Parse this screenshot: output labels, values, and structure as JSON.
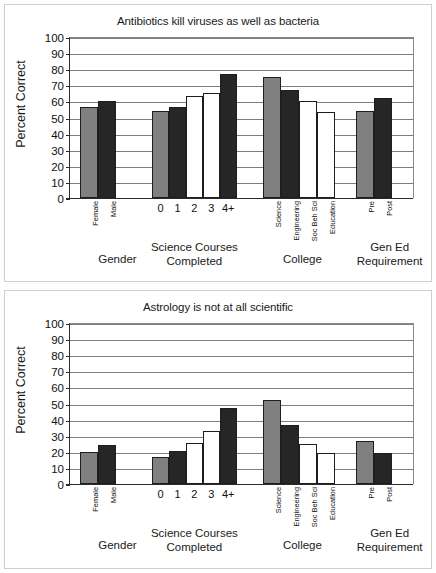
{
  "figure": {
    "ylabel": "Percent Correct",
    "y_ticks": [
      "100",
      "90",
      "80",
      "70",
      "60",
      "50",
      "40",
      "30",
      "20",
      "10",
      "0"
    ],
    "group_captions": [
      "Gender",
      "Science Courses\nCompleted",
      "College",
      "Gen Ed\nRequirement"
    ],
    "colors": {
      "gray_bar": "#808080",
      "dark_bar": "#262626",
      "white_bar": "#ffffff",
      "axis": "#2b2b2b",
      "gridline": "#7d7d7d"
    }
  },
  "chart_data": [
    {
      "type": "bar",
      "title": "Antibiotics kill viruses as well as bacteria",
      "xlabel": "",
      "ylabel": "Percent Correct",
      "ylim": [
        0,
        100
      ],
      "yticks": [
        0,
        10,
        20,
        30,
        40,
        50,
        60,
        70,
        80,
        90,
        100
      ],
      "grid": true,
      "legend": "none",
      "groups": [
        {
          "name": "Gender",
          "categories": [
            "Female",
            "Male"
          ],
          "values": [
            56.5,
            60
          ],
          "fills": [
            "gray",
            "dark"
          ],
          "label_orientation": "rotated"
        },
        {
          "name": "Science Courses Completed",
          "categories": [
            "0",
            "1",
            "2",
            "3",
            "4+"
          ],
          "values": [
            54,
            56.5,
            63.5,
            65.5,
            77
          ],
          "fills": [
            "gray",
            "dark",
            "white",
            "white",
            "dark"
          ],
          "label_orientation": "upright"
        },
        {
          "name": "College",
          "categories": [
            "Science",
            "Engineering",
            "Soc Beh Sci",
            "Education"
          ],
          "values": [
            75,
            67,
            60.5,
            53.5
          ],
          "fills": [
            "gray",
            "dark",
            "white",
            "white"
          ],
          "label_orientation": "rotated"
        },
        {
          "name": "Gen Ed Requirement",
          "categories": [
            "Pre",
            "Post"
          ],
          "values": [
            54,
            62
          ],
          "fills": [
            "gray",
            "dark"
          ],
          "label_orientation": "rotated"
        }
      ]
    },
    {
      "type": "bar",
      "title": "Astrology is not at all scientific",
      "xlabel": "",
      "ylabel": "Percent Correct",
      "ylim": [
        0,
        100
      ],
      "yticks": [
        0,
        10,
        20,
        30,
        40,
        50,
        60,
        70,
        80,
        90,
        100
      ],
      "grid": true,
      "legend": "none",
      "groups": [
        {
          "name": "Gender",
          "categories": [
            "Female",
            "Male"
          ],
          "values": [
            20,
            24
          ],
          "fills": [
            "gray",
            "dark"
          ],
          "label_orientation": "rotated"
        },
        {
          "name": "Science Courses Completed",
          "categories": [
            "0",
            "1",
            "2",
            "3",
            "4+"
          ],
          "values": [
            17,
            20.5,
            25.5,
            33,
            47.5
          ],
          "fills": [
            "gray",
            "dark",
            "white",
            "white",
            "dark"
          ],
          "label_orientation": "upright"
        },
        {
          "name": "College",
          "categories": [
            "Science",
            "Engineering",
            "Soc Beh Sci",
            "Education"
          ],
          "values": [
            52,
            36.5,
            25,
            19
          ],
          "fills": [
            "gray",
            "dark",
            "white",
            "white"
          ],
          "label_orientation": "rotated"
        },
        {
          "name": "Gen Ed Requirement",
          "categories": [
            "Pre",
            "Post"
          ],
          "values": [
            26.5,
            19
          ],
          "fills": [
            "gray",
            "dark"
          ],
          "label_orientation": "rotated"
        }
      ]
    }
  ]
}
